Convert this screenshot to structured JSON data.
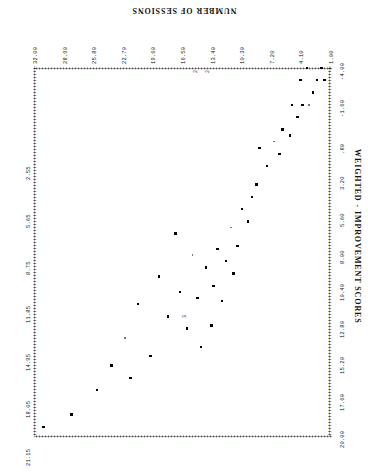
{
  "chart_data": {
    "type": "scatter",
    "title": "",
    "xlabel": "NUMBER OF SESSIONS",
    "ylabel": "WEIGHTED · IMPROVEMENT SCORES",
    "xlim": [
      1.0,
      32.0
    ],
    "ylim": [
      -4.0,
      20.0
    ],
    "grid": false,
    "legend": null,
    "x_ticks": [
      "1.00",
      "4.10",
      "7.20",
      "10.30",
      "13.40",
      "16.50",
      "19.60",
      "22.70",
      "25.80",
      "28.90",
      "32.00"
    ],
    "y_ticks": [
      "-4.00",
      "-1.60",
      ".80",
      "3.20",
      "5.60",
      "8.00",
      "10.40",
      "12.80",
      "15.20",
      "17.60",
      "20.00"
    ],
    "y_minor_ticks": [
      "2.55",
      "5.65",
      "8.75",
      "11.85",
      "14.95",
      "18.05",
      "21.15",
      "24.25",
      "27.35",
      "30.45"
    ],
    "points": [
      {
        "x": 1.8,
        "y": -3.2
      },
      {
        "x": 2.1,
        "y": -4.0
      },
      {
        "x": 2.6,
        "y": -3.2
      },
      {
        "x": 3.0,
        "y": -2.4
      },
      {
        "x": 3.4,
        "y": -1.6
      },
      {
        "x": 3.6,
        "y": -4.0
      },
      {
        "x": 4.1,
        "y": -1.6
      },
      {
        "x": 4.3,
        "y": -3.2
      },
      {
        "x": 4.6,
        "y": -0.8
      },
      {
        "x": 5.2,
        "y": -1.6
      },
      {
        "x": 5.4,
        "y": 0.4
      },
      {
        "x": 6.2,
        "y": 0.0
      },
      {
        "x": 6.5,
        "y": 1.6
      },
      {
        "x": 7.1,
        "y": 0.8
      },
      {
        "x": 7.8,
        "y": 2.4
      },
      {
        "x": 8.6,
        "y": 1.2
      },
      {
        "x": 8.9,
        "y": 3.6
      },
      {
        "x": 9.4,
        "y": 4.4
      },
      {
        "x": 9.8,
        "y": 6.0
      },
      {
        "x": 10.4,
        "y": 5.2
      },
      {
        "x": 10.9,
        "y": 7.6
      },
      {
        "x": 11.3,
        "y": 9.4
      },
      {
        "x": 11.6,
        "y": 6.4
      },
      {
        "x": 12.1,
        "y": 8.6
      },
      {
        "x": 12.5,
        "y": 11.2
      },
      {
        "x": 13.0,
        "y": 7.8
      },
      {
        "x": 13.4,
        "y": 10.2
      },
      {
        "x": 13.6,
        "y": 12.8
      },
      {
        "x": 14.2,
        "y": 9.0
      },
      {
        "x": 14.7,
        "y": 14.2
      },
      {
        "x": 15.1,
        "y": 11.0
      },
      {
        "x": 15.6,
        "y": 8.2
      },
      {
        "x": 16.2,
        "y": 13.0
      },
      {
        "x": 16.9,
        "y": 10.6
      },
      {
        "x": 17.4,
        "y": 6.8
      },
      {
        "x": 18.2,
        "y": 12.2
      },
      {
        "x": 19.1,
        "y": 9.6
      },
      {
        "x": 20.0,
        "y": 14.8
      },
      {
        "x": 21.3,
        "y": 11.4
      },
      {
        "x": 22.1,
        "y": 16.2
      },
      {
        "x": 22.7,
        "y": 13.6
      },
      {
        "x": 24.1,
        "y": 15.4
      },
      {
        "x": 25.6,
        "y": 17.0
      },
      {
        "x": 28.3,
        "y": 18.6
      },
      {
        "x": 31.2,
        "y": 19.4
      }
    ]
  },
  "axes": {
    "x_title": "NUMBER OF SESSIONS",
    "y_title": "WEIGHTED · IMPROVEMENT SCORES"
  },
  "frame": {
    "dash_glyph": "++++++++++++++++++++++++++++++++++++++++++++++++++++++++++++++++++++++++++++++++++++++++++++++++++++++++++++++++++++++++++++++++++++"
  },
  "overlap_markers": [
    {
      "label": "2",
      "x": 13.9,
      "y": -3.85
    },
    {
      "label": "2",
      "x": 15.1,
      "y": -3.85
    },
    {
      "label": "3",
      "x": 16.3,
      "y": 12.1
    }
  ]
}
